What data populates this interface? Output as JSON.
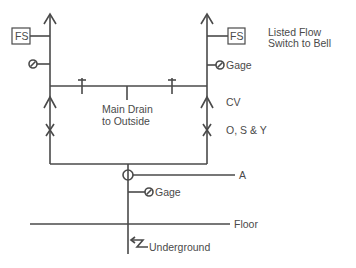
{
  "diagram": {
    "colors": {
      "line": "#4a4a4a",
      "background": "#ffffff"
    },
    "labels": {
      "fs_left": "FS",
      "fs_right": "FS",
      "flow_switch_line1": "Listed Flow",
      "flow_switch_line2": "Switch to Bell",
      "gage_right": "Gage",
      "gage_bottom": "Gage",
      "main_drain_line1": "Main Drain",
      "main_drain_line2": "to Outside",
      "cv": "CV",
      "osy": "O, S & Y",
      "a": "A",
      "floor": "Floor",
      "underground": "Underground"
    },
    "components": [
      {
        "id": "flow-switch-left",
        "type": "flow-switch"
      },
      {
        "id": "flow-switch-right",
        "type": "flow-switch"
      },
      {
        "id": "gage-left",
        "type": "gage"
      },
      {
        "id": "gage-right",
        "type": "gage"
      },
      {
        "id": "gage-main",
        "type": "gage"
      },
      {
        "id": "check-valve-left",
        "type": "check-valve"
      },
      {
        "id": "check-valve-right",
        "type": "check-valve"
      },
      {
        "id": "osy-valve-left",
        "type": "gate-valve"
      },
      {
        "id": "osy-valve-right",
        "type": "gate-valve"
      },
      {
        "id": "valve-a",
        "type": "circle-valve"
      }
    ]
  }
}
